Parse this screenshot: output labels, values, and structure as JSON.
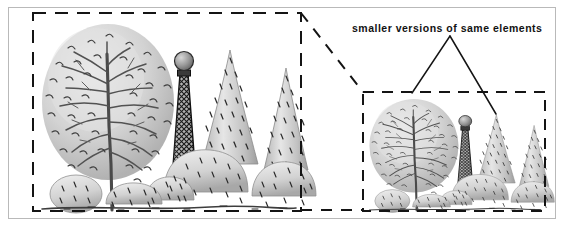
{
  "figure": {
    "type": "illustration-diagram",
    "background_color": "#ffffff",
    "frame_color": "#b9b9b9",
    "ink_color": "#1a1a1a",
    "annotation": {
      "label": "smaller versions of same elements",
      "leader_lines": 2
    },
    "panels": [
      {
        "id": "left-panel",
        "name": "large-scale-planting-scene",
        "border_style": "dashed",
        "relative_scale": "large",
        "elements": [
          {
            "name": "deciduous-tree",
            "label": "deciduous tree"
          },
          {
            "name": "lattice-obelisk",
            "label": "lattice obelisk with ball finial"
          },
          {
            "name": "conical-evergreen",
            "label": "conical evergreen"
          },
          {
            "name": "mounded-shrub",
            "label": "mounded shrub"
          },
          {
            "name": "ground-cover",
            "label": "ground cover"
          }
        ]
      },
      {
        "id": "right-panel",
        "name": "small-scale-planting-scene",
        "border_style": "dashed",
        "relative_scale": "small",
        "elements": [
          {
            "name": "deciduous-tree",
            "label": "deciduous tree"
          },
          {
            "name": "lattice-obelisk",
            "label": "lattice obelisk with ball finial"
          },
          {
            "name": "conical-evergreen",
            "label": "conical evergreen"
          },
          {
            "name": "mounded-shrub",
            "label": "mounded shrub"
          },
          {
            "name": "ground-cover",
            "label": "ground cover"
          }
        ]
      }
    ],
    "connectors": [
      {
        "name": "diagonal-dashed-connector",
        "from": "left-panel-top-right",
        "to": "right-panel-top-left"
      },
      {
        "name": "horizontal-dashed-connector",
        "from": "left-panel-bottom-right",
        "to": "right-panel-bottom-left"
      }
    ]
  }
}
